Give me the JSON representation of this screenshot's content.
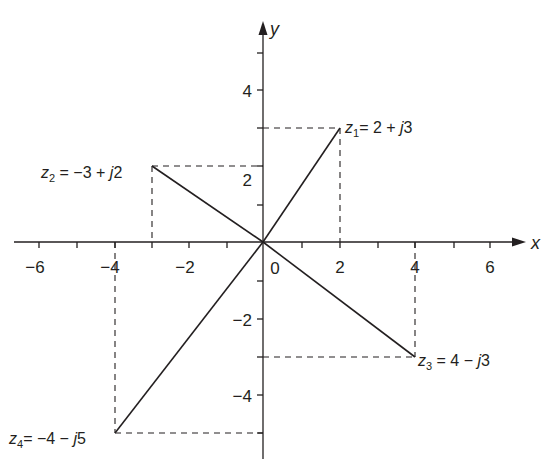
{
  "axes": {
    "x_label": "x",
    "y_label": "y",
    "x_tick_labels": [
      {
        "value": -6,
        "text": "−6"
      },
      {
        "value": -4,
        "text": "−4"
      },
      {
        "value": -2,
        "text": "−2"
      },
      {
        "value": 0,
        "text": "0"
      },
      {
        "value": 2,
        "text": "2"
      },
      {
        "value": 4,
        "text": "4"
      },
      {
        "value": 6,
        "text": "6"
      }
    ],
    "y_tick_labels": [
      {
        "value": 4,
        "text": "4"
      },
      {
        "value": 2,
        "text": "2"
      },
      {
        "value": -2,
        "text": "−2"
      },
      {
        "value": -4,
        "text": "−4"
      }
    ]
  },
  "points": [
    {
      "name": "z",
      "sub": "1",
      "eq": "= 2 + ",
      "j": "j",
      "tail": "3",
      "re": 2,
      "im": 3
    },
    {
      "name": "z",
      "sub": "2",
      "eq": " = −3 + ",
      "j": "j",
      "tail": "2",
      "re": -3,
      "im": 2
    },
    {
      "name": "z",
      "sub": "3",
      "eq": " = 4 − ",
      "j": "j",
      "tail": "3",
      "re": 4,
      "im": -3
    },
    {
      "name": "z",
      "sub": "4",
      "eq": "= −4 − ",
      "j": "j",
      "tail": "5",
      "re": -4,
      "im": -5
    }
  ],
  "colors": {
    "ink": "#231f20",
    "background": "#ffffff"
  }
}
